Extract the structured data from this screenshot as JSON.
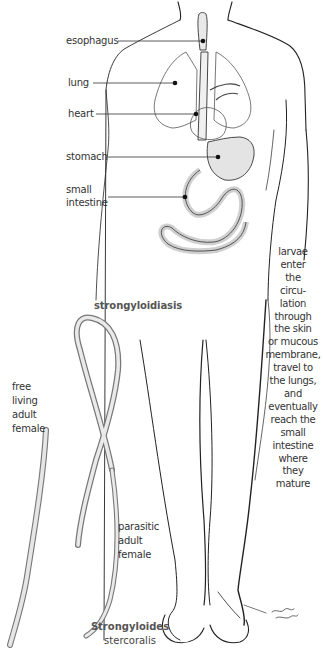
{
  "diagram": {
    "title": "strongyloidiasis",
    "organ_labels": {
      "esophagus": "esophagus",
      "lung": "lung",
      "heart": "heart",
      "stomach": "stomach",
      "small_intestine": [
        "small",
        "intestine"
      ]
    },
    "larvae_caption": [
      "larvae",
      "enter",
      "the",
      "circu-",
      "lation",
      "through",
      "the skin",
      "or mucous",
      "membrane,",
      "travel to",
      "the lungs,",
      "and",
      "eventually",
      "reach the",
      "small",
      "intestine",
      "where",
      "they",
      "mature"
    ],
    "free_living_label": [
      "free",
      "living",
      "adult",
      "female"
    ],
    "parasitic_label": [
      "parasitic",
      "adult",
      "female"
    ],
    "species": {
      "genus": "Strongyloides",
      "epithet": "stercoralis"
    }
  }
}
